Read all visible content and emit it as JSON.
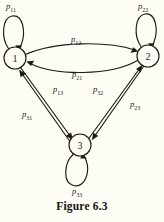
{
  "figure": {
    "caption": "Figure 6.3",
    "background_color": "#fdfdf6",
    "ink_color": "#1d1a16"
  },
  "diagram": {
    "type": "state-transition-diagram",
    "nodes": [
      {
        "id": "1",
        "label": "1",
        "cx": 15,
        "cy": 58,
        "r": 11
      },
      {
        "id": "2",
        "label": "2",
        "cx": 148,
        "cy": 56,
        "r": 11
      },
      {
        "id": "3",
        "label": "3",
        "cx": 80,
        "cy": 145,
        "r": 11
      }
    ],
    "edges": [
      {
        "id": "p11",
        "from": "1",
        "to": "1",
        "kind": "self-loop",
        "label_base": "p",
        "label_sub": "11"
      },
      {
        "id": "p22",
        "from": "2",
        "to": "2",
        "kind": "self-loop",
        "label_base": "p",
        "label_sub": "22"
      },
      {
        "id": "p33",
        "from": "3",
        "to": "3",
        "kind": "self-loop",
        "label_base": "p",
        "label_sub": "33"
      },
      {
        "id": "p12",
        "from": "1",
        "to": "2",
        "kind": "curve",
        "label_base": "p",
        "label_sub": "12"
      },
      {
        "id": "p21",
        "from": "2",
        "to": "1",
        "kind": "curve",
        "label_base": "p",
        "label_sub": "21"
      },
      {
        "id": "p13",
        "from": "1",
        "to": "3",
        "kind": "line",
        "label_base": "p",
        "label_sub": "13"
      },
      {
        "id": "p31",
        "from": "3",
        "to": "1",
        "kind": "line",
        "label_base": "p",
        "label_sub": "31"
      },
      {
        "id": "p23",
        "from": "2",
        "to": "3",
        "kind": "line",
        "label_base": "p",
        "label_sub": "23"
      },
      {
        "id": "p32",
        "from": "3",
        "to": "2",
        "kind": "line",
        "label_base": "p",
        "label_sub": "32"
      }
    ],
    "labels": {
      "p11": {
        "base": "p",
        "sub": "11",
        "x": 6,
        "y": 1
      },
      "p22": {
        "base": "p",
        "sub": "22",
        "x": 138,
        "y": 1
      },
      "p12": {
        "base": "p",
        "sub": "12",
        "x": 71,
        "y": 34
      },
      "p21": {
        "base": "p",
        "sub": "21",
        "x": 72,
        "y": 69
      },
      "p13": {
        "base": "p",
        "sub": "13",
        "x": 53,
        "y": 84
      },
      "p31": {
        "base": "p",
        "sub": "31",
        "x": 22,
        "y": 109
      },
      "p32": {
        "base": "p",
        "sub": "32",
        "x": 93,
        "y": 84
      },
      "p23": {
        "base": "p",
        "sub": "23",
        "x": 130,
        "y": 99
      },
      "p33": {
        "base": "p",
        "sub": "33",
        "x": 72,
        "y": 186
      }
    },
    "node_label_positions": {
      "n1": {
        "x": 15,
        "y": 61.5
      },
      "n2": {
        "x": 148,
        "y": 59.5
      },
      "n3": {
        "x": 80,
        "y": 148.5
      }
    }
  },
  "caption_position": {
    "y": 200
  }
}
